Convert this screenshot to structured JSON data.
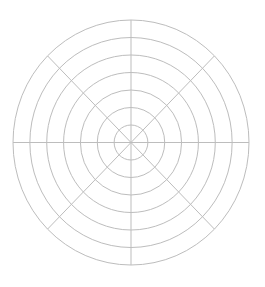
{
  "chart_data": {
    "type": "polar-grid",
    "title": "",
    "rings": 7,
    "spokes": 8,
    "spoke_angles_deg": [
      0,
      45,
      90,
      135,
      180,
      225,
      270,
      315
    ],
    "grid": true,
    "series": [],
    "tick_labels": [],
    "legend": null
  },
  "style": {
    "background": "#ffffff",
    "grid_color": "#bdbdbd",
    "center_x": 131,
    "center_y": 142.5,
    "outer_rx": 118,
    "outer_ry": 122.5
  }
}
